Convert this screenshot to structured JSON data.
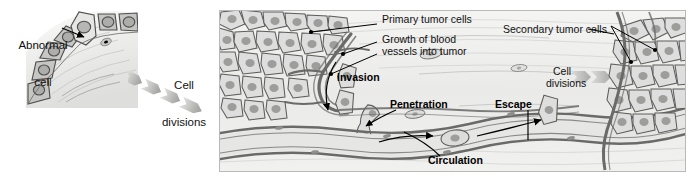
{
  "figure": {
    "type": "biological-process-diagram",
    "background_color": "#ffffff",
    "panel_background_color": "#efefee"
  },
  "left_panel": {
    "name": "epithelium-with-abnormal-cell",
    "label": "Abnormal\ncell",
    "label_line1": "Abnormal",
    "label_line2": "cell",
    "description": "Row of normal epithelial cells with one lighter abnormal cell"
  },
  "transition": {
    "label_line1": "Cell",
    "label_line2": "divisions",
    "arrow_count": 4,
    "direction": "down-right"
  },
  "main_panel": {
    "labels": [
      {
        "id": "primary-tumor-cells",
        "text": "Primary tumor cells",
        "style": "plain"
      },
      {
        "id": "growth-of-blood-vessels",
        "text": "Growth of blood",
        "style": "plain"
      },
      {
        "id": "growth-of-blood-vessels-2",
        "text": "vessels into tumor",
        "style": "plain"
      },
      {
        "id": "secondary-tumor-cells",
        "text": "Secondary tumor cells",
        "style": "plain"
      },
      {
        "id": "invasion",
        "text": "Invasion",
        "style": "bold"
      },
      {
        "id": "penetration",
        "text": "Penetration",
        "style": "bold"
      },
      {
        "id": "escape",
        "text": "Escape",
        "style": "bold"
      },
      {
        "id": "circulation",
        "text": "Circulation",
        "style": "bold"
      },
      {
        "id": "cell-divisions-right-1",
        "text": "Cell",
        "style": "plain"
      },
      {
        "id": "cell-divisions-right-2",
        "text": "divisions",
        "style": "plain"
      }
    ],
    "stages": [
      "Primary tumor cells",
      "Growth of blood vessels into tumor",
      "Invasion",
      "Penetration",
      "Circulation",
      "Escape",
      "Cell divisions",
      "Secondary tumor cells"
    ]
  },
  "colors": {
    "panel_bg": "#efefee",
    "tissue_light": "#f2f2f1",
    "cell_fill": "#d8d8d6",
    "cell_fill_light": "#e9e9e7",
    "nucleus": "#9a9a98",
    "outline": "#5a5a58",
    "vessel_wall": "#7c7c7a",
    "arrow_gray": "#b5b5b3",
    "text": "#111111"
  }
}
